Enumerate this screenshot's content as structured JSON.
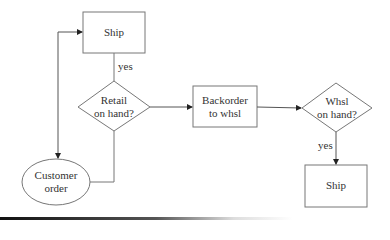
{
  "diagram": {
    "type": "flowchart",
    "nodes": [
      {
        "id": "ship_top",
        "shape": "rect",
        "label": "Ship"
      },
      {
        "id": "retail_check",
        "shape": "diamond",
        "label_line1": "Retail",
        "label_line2": "on hand?"
      },
      {
        "id": "backorder",
        "shape": "rect",
        "label_line1": "Backorder",
        "label_line2": "to whsl"
      },
      {
        "id": "whsl_check",
        "shape": "diamond",
        "label_line1": "Whsl",
        "label_line2": "on hand?"
      },
      {
        "id": "ship_bottom",
        "shape": "rect",
        "label": "Ship"
      },
      {
        "id": "customer_order",
        "shape": "ellipse",
        "label_line1": "Customer",
        "label_line2": "order"
      }
    ],
    "edges": [
      {
        "from": "customer_order",
        "to": "retail_check"
      },
      {
        "from": "retail_check",
        "to": "ship_top",
        "label": "yes"
      },
      {
        "from": "retail_check",
        "to": "backorder"
      },
      {
        "from": "backorder",
        "to": "whsl_check"
      },
      {
        "from": "whsl_check",
        "to": "ship_bottom",
        "label": "yes"
      },
      {
        "from": "ship_top",
        "to": "customer_order",
        "bidirectional": true
      }
    ],
    "edge_labels": {
      "yes1": "yes",
      "yes2": "yes"
    },
    "colors": {
      "stroke": "#666666",
      "text": "#333333"
    }
  }
}
